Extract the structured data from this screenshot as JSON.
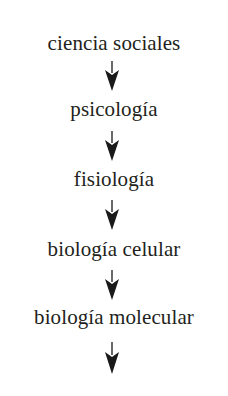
{
  "diagram": {
    "type": "vertical-flow",
    "direction": "top-to-bottom",
    "nodes": [
      {
        "label": "ciencia sociales"
      },
      {
        "label": "psicología"
      },
      {
        "label": "fisiología"
      },
      {
        "label": "biología celular"
      },
      {
        "label": "biología molecular"
      }
    ],
    "arrow_count": 5,
    "colors": {
      "text": "#231f20",
      "arrow": "#1a1a1a",
      "background": "#ffffff"
    }
  }
}
